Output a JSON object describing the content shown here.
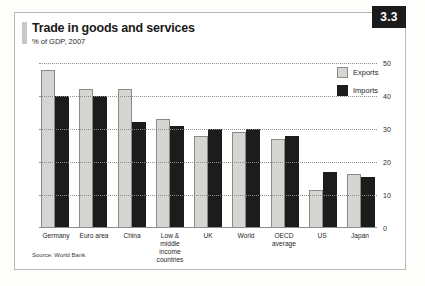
{
  "card": {
    "title": "Trade in goods and services",
    "subtitle": "% of GDP, 2007",
    "badge": "3.3",
    "source": "Source: World Bank"
  },
  "legend": {
    "exports_label": "Exports",
    "imports_label": "Imports"
  },
  "colors": {
    "exports": "#d5d5d2",
    "imports": "#1c1c1c",
    "badge_bg": "#1b1b1b",
    "grid": "#8e8e8a"
  },
  "chart_data": {
    "type": "bar",
    "title": "Trade in goods and services",
    "subtitle": "% of GDP, 2007",
    "xlabel": "",
    "ylabel": "% of GDP",
    "ylim": [
      0,
      50
    ],
    "yticks": [
      0,
      10,
      20,
      30,
      40,
      50
    ],
    "grid": true,
    "legend_position": "top-right",
    "source": "Source: World Bank",
    "categories": [
      "Germany",
      "Euro area",
      "China",
      "Low & middle income countries",
      "UK",
      "World",
      "OECD average",
      "US",
      "Japan"
    ],
    "series": [
      {
        "name": "Exports",
        "values": [
          48,
          42,
          42,
          33,
          28,
          29,
          27,
          11.5,
          16.5
        ]
      },
      {
        "name": "Imports",
        "values": [
          40,
          40,
          32,
          31,
          30,
          30,
          28,
          17,
          15.5
        ]
      }
    ]
  }
}
